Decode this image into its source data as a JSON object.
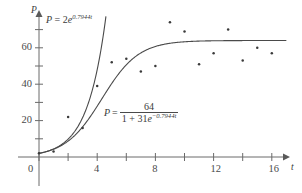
{
  "chart_data": {
    "type": "scatter",
    "title": "",
    "xlabel": "t",
    "ylabel": "P",
    "xlim": [
      -1,
      17.5
    ],
    "ylim": [
      -4,
      78
    ],
    "grid": false,
    "legend": "none",
    "x_ticks": [
      0,
      2,
      4,
      6,
      8,
      10,
      12,
      14,
      16
    ],
    "x_tick_labels": [
      "0",
      "",
      "4",
      "",
      "8",
      "",
      "12",
      "",
      "16"
    ],
    "y_ticks": [
      10,
      20,
      30,
      40,
      50,
      60,
      70
    ],
    "y_tick_labels": [
      "",
      "20",
      "",
      "40",
      "",
      "60",
      ""
    ],
    "points": [
      {
        "x": 0,
        "y": 2
      },
      {
        "x": 1,
        "y": 3
      },
      {
        "x": 2,
        "y": 22
      },
      {
        "x": 3,
        "y": 16
      },
      {
        "x": 4,
        "y": 39
      },
      {
        "x": 5,
        "y": 52
      },
      {
        "x": 6,
        "y": 54
      },
      {
        "x": 7,
        "y": 47
      },
      {
        "x": 8,
        "y": 50
      },
      {
        "x": 9,
        "y": 74
      },
      {
        "x": 10,
        "y": 69
      },
      {
        "x": 11,
        "y": 51
      },
      {
        "x": 12,
        "y": 57
      },
      {
        "x": 13,
        "y": 70
      },
      {
        "x": 14,
        "y": 53
      },
      {
        "x": 15,
        "y": 60
      },
      {
        "x": 16,
        "y": 57
      }
    ],
    "series": [
      {
        "name": "exponential-model",
        "equation": "P = 2e^(0.7944t)",
        "type": "line",
        "formula": "exponential",
        "a": 2,
        "k": 0.7944
      },
      {
        "name": "logistic-model",
        "equation": "P = 64 / (1 + 31e^(-0.7944t))",
        "type": "line",
        "formula": "logistic",
        "carrying_capacity": 64,
        "a": 31,
        "k": 0.7944
      }
    ]
  },
  "axes": {
    "x_axis_label": "t",
    "y_axis_label": "P"
  },
  "tick_labels": {
    "x": [
      "0",
      "4",
      "8",
      "12",
      "16"
    ],
    "y": [
      "20",
      "40",
      "60"
    ]
  },
  "annotations": {
    "exponential": {
      "lhs": "P",
      "equals": "=",
      "base": "2e",
      "exponent": "0.7944t"
    },
    "logistic": {
      "lhs": "P",
      "equals": "=",
      "numerator": "64",
      "denominator_lead": "1 + 31e",
      "denominator_exponent": "−0.7944t"
    }
  },
  "colors": {
    "axis": "#5a5a5a",
    "curve": "#4a4a4a",
    "point": "#3a3a3a",
    "text": "#3a3a3a",
    "background": "#ffffff"
  }
}
